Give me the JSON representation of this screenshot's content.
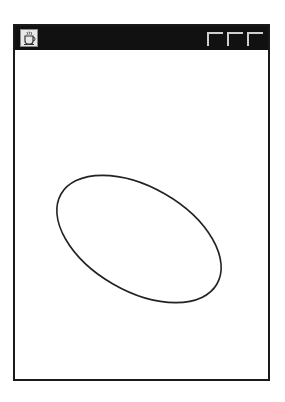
{
  "window": {
    "title": "",
    "app_icon": "coffee-cup-icon",
    "controls": [
      "minimize",
      "maximize",
      "close"
    ]
  },
  "canvas": {
    "shape": "ellipse",
    "stroke": "#222222",
    "cx": 124,
    "cy": 189,
    "rx": 90,
    "ry": 52,
    "rotation_deg": 30
  }
}
